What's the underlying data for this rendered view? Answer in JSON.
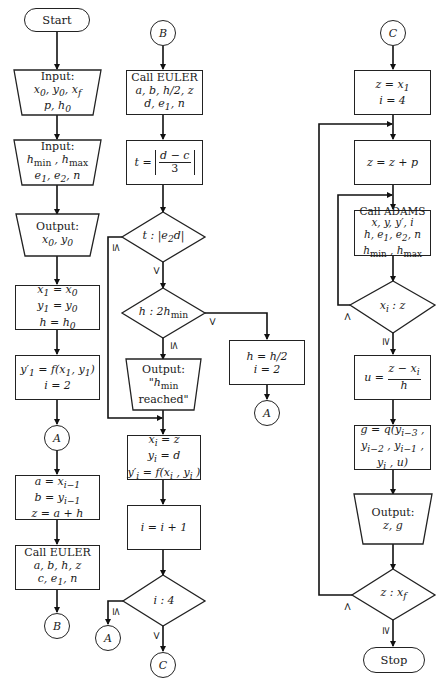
{
  "diagram": {
    "type": "flowchart",
    "columns": [
      {
        "id": "col1",
        "nodes": [
          {
            "id": "start",
            "shape": "terminal",
            "lines": [
              "Start"
            ]
          },
          {
            "id": "input1",
            "shape": "input-trapezoid",
            "lines": [
              "Input:",
              "x₀, y₀, x_f",
              "p, h₀"
            ]
          },
          {
            "id": "input2",
            "shape": "input-trapezoid",
            "lines": [
              "Input:",
              "h_min , h_max",
              "e₁, e₂, n"
            ]
          },
          {
            "id": "output1",
            "shape": "output-trapezoid",
            "lines": [
              "Output:",
              "x₀, y₀"
            ]
          },
          {
            "id": "init",
            "shape": "process",
            "lines": [
              "x₁ = x₀",
              "y₁ = y₀",
              "h = h₀"
            ]
          },
          {
            "id": "deriv",
            "shape": "process",
            "lines": [
              "y′₁ = f(x₁, y₁)",
              "i = 2"
            ]
          },
          {
            "id": "connA1",
            "shape": "connector",
            "lines": [
              "A"
            ]
          },
          {
            "id": "assign",
            "shape": "process",
            "lines": [
              "a = x_{i−1}",
              "b = y_{i−1}",
              "z = a + h"
            ]
          },
          {
            "id": "euler1",
            "shape": "process",
            "lines": [
              "Call EULER",
              "a, b, h, z",
              "c, e₁, n"
            ]
          },
          {
            "id": "connB1",
            "shape": "connector",
            "lines": [
              "B"
            ]
          }
        ]
      },
      {
        "id": "col2",
        "nodes": [
          {
            "id": "connB2",
            "shape": "connector",
            "lines": [
              "B"
            ]
          },
          {
            "id": "euler2",
            "shape": "process",
            "lines": [
              "Call EULER",
              "a, b, h/2, z",
              "d, e₁, n"
            ]
          },
          {
            "id": "tcalc",
            "shape": "process",
            "lines": [
              "t = | (d − c) / 3 |"
            ]
          },
          {
            "id": "dec_t",
            "shape": "decision",
            "lines": [
              "t : |e₂d|"
            ]
          },
          {
            "id": "dec_h",
            "shape": "decision",
            "lines": [
              "h : 2h_min"
            ]
          },
          {
            "id": "out_hmin",
            "shape": "output-trapezoid",
            "lines": [
              "Output:",
              "\"h_min",
              "reached\""
            ]
          },
          {
            "id": "store",
            "shape": "process",
            "lines": [
              "x_i = z",
              "y_i = d",
              "y′_i = f(x_i , y_i )"
            ]
          },
          {
            "id": "incr",
            "shape": "process",
            "lines": [
              "i = i + 1"
            ]
          },
          {
            "id": "dec_i",
            "shape": "decision",
            "lines": [
              "i : 4"
            ]
          },
          {
            "id": "connA2",
            "shape": "connector",
            "lines": [
              "A"
            ]
          },
          {
            "id": "connC1",
            "shape": "connector",
            "lines": [
              "C"
            ]
          },
          {
            "id": "halve",
            "shape": "process",
            "lines": [
              "h = h/2",
              "i = 2"
            ]
          },
          {
            "id": "connA3",
            "shape": "connector",
            "lines": [
              "A"
            ]
          }
        ]
      },
      {
        "id": "col3",
        "nodes": [
          {
            "id": "connC2",
            "shape": "connector",
            "lines": [
              "C"
            ]
          },
          {
            "id": "zinit",
            "shape": "process",
            "lines": [
              "z = x₁",
              "i = 4"
            ]
          },
          {
            "id": "zstep",
            "shape": "process",
            "lines": [
              "z = z + p"
            ]
          },
          {
            "id": "adams",
            "shape": "process",
            "lines": [
              "Call ADAMS",
              "x, y, y′, i",
              "h, e₁, e₂, n",
              "h_min , h_max"
            ]
          },
          {
            "id": "dec_xi",
            "shape": "decision",
            "lines": [
              "x_i : z"
            ]
          },
          {
            "id": "ucalc",
            "shape": "process",
            "lines": [
              "u = (z − x_i) / h"
            ]
          },
          {
            "id": "gcalc",
            "shape": "process",
            "lines": [
              "g = q(y_{i−3} ,",
              "y_{i−2} , y_{i−1} ,",
              "y_i , u)"
            ]
          },
          {
            "id": "out_zg",
            "shape": "output-trapezoid",
            "lines": [
              "Output:",
              "z, g"
            ]
          },
          {
            "id": "dec_z",
            "shape": "decision",
            "lines": [
              "z : x_f"
            ]
          },
          {
            "id": "stop",
            "shape": "terminal",
            "lines": [
              "Stop"
            ]
          }
        ]
      }
    ],
    "edge_labels": {
      "dec_t_le": "≤",
      "dec_t_gt": ">",
      "dec_h_gt": ">",
      "dec_h_le": "≤",
      "dec_i_le": "≤",
      "dec_i_gt": ">",
      "dec_xi_lt": "<",
      "dec_xi_ge": "≥",
      "dec_z_lt": "<",
      "dec_z_ge": "≥"
    },
    "edges": [
      [
        "start",
        "input1"
      ],
      [
        "input1",
        "input2"
      ],
      [
        "input2",
        "output1"
      ],
      [
        "output1",
        "init"
      ],
      [
        "init",
        "deriv"
      ],
      [
        "deriv",
        "connA1"
      ],
      [
        "connA1",
        "assign"
      ],
      [
        "assign",
        "euler1"
      ],
      [
        "euler1",
        "connB1"
      ],
      [
        "connB2",
        "euler2"
      ],
      [
        "euler2",
        "tcalc"
      ],
      [
        "tcalc",
        "dec_t"
      ],
      [
        "dec_t",
        "dec_h",
        "> "
      ],
      [
        "dec_t",
        "store",
        "≤"
      ],
      [
        "dec_h",
        "out_hmin",
        "≤"
      ],
      [
        "dec_h",
        "halve",
        ">"
      ],
      [
        "out_hmin",
        "store"
      ],
      [
        "halve",
        "connA3"
      ],
      [
        "store",
        "incr"
      ],
      [
        "incr",
        "dec_i"
      ],
      [
        "dec_i",
        "connA2",
        "≤"
      ],
      [
        "dec_i",
        "connC1",
        ">"
      ],
      [
        "connC2",
        "zinit"
      ],
      [
        "zinit",
        "zstep"
      ],
      [
        "zstep",
        "adams"
      ],
      [
        "adams",
        "dec_xi"
      ],
      [
        "dec_xi",
        "zstep",
        "<"
      ],
      [
        "dec_xi",
        "ucalc",
        "≥"
      ],
      [
        "ucalc",
        "gcalc"
      ],
      [
        "gcalc",
        "out_zg"
      ],
      [
        "out_zg",
        "dec_z"
      ],
      [
        "dec_z",
        "zstep",
        "<"
      ],
      [
        "dec_z",
        "stop",
        "≥"
      ]
    ]
  },
  "text": {
    "start": "Start",
    "stop": "Stop",
    "input_label": "Input:",
    "output_label": "Output:",
    "call_euler": "Call EULER",
    "call_adams": "Call ADAMS",
    "conn_a": "A",
    "conn_b": "B",
    "conn_c": "C",
    "reached": "reached\"",
    "quote_open": "\""
  }
}
